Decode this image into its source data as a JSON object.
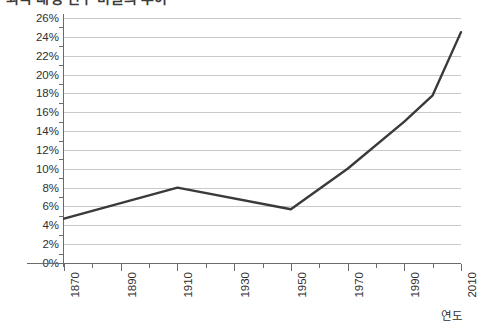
{
  "chart_data": {
    "type": "line",
    "title": "외국 태생 인구 비율의 추이",
    "xlabel": "연도",
    "ylabel": "",
    "xlim": [
      1870,
      2010
    ],
    "ylim": [
      0,
      26
    ],
    "y_tick_step": 2,
    "x_tick_step": 10,
    "x_label_step": 20,
    "grid": true,
    "legend": "none",
    "line_color": "#3a3a3a",
    "grid_color": "#c9c9c9",
    "axis_color": "#6b6b6b",
    "y_ticks": [
      "0%",
      "2%",
      "4%",
      "6%",
      "8%",
      "10%",
      "12%",
      "14%",
      "16%",
      "18%",
      "20%",
      "22%",
      "24%",
      "26%"
    ],
    "y_tick_values": [
      0,
      2,
      4,
      6,
      8,
      10,
      12,
      14,
      16,
      18,
      20,
      22,
      24,
      26
    ],
    "x_ticks": [
      1870,
      1880,
      1890,
      1900,
      1910,
      1920,
      1930,
      1940,
      1950,
      1960,
      1970,
      1980,
      1990,
      2000,
      2010
    ],
    "x_tick_labels": [
      "1870",
      "1890",
      "1910",
      "1930",
      "1950",
      "1970",
      "1990",
      "2010"
    ],
    "x_tick_label_values": [
      1870,
      1890,
      1910,
      1930,
      1950,
      1970,
      1990,
      2010
    ],
    "series": [
      {
        "name": "외국 태생 인구 비율",
        "x": [
          1870,
          1910,
          1950,
          1970,
          1990,
          2000,
          2010
        ],
        "values": [
          4.7,
          8.0,
          5.7,
          10.0,
          15.0,
          17.8,
          24.5
        ]
      }
    ]
  }
}
